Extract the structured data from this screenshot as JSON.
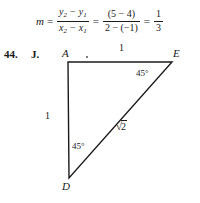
{
  "formula": {
    "variable": "m",
    "equals": "=",
    "slope_general": {
      "numerator_y2": "y",
      "numerator_sub2": "2",
      "minus": "−",
      "numerator_y1": "y",
      "numerator_sub1": "1",
      "denominator_x2": "x",
      "denominator_x1": "x"
    },
    "slope_substituted": {
      "numerator": "(5 − 4)",
      "denominator": "2 − (−1)"
    },
    "result": {
      "numerator": "1",
      "denominator": "3"
    }
  },
  "problem": {
    "number": "44.",
    "letter": "J."
  },
  "figure": {
    "type": "right-triangle",
    "vertices": [
      {
        "label": "A",
        "x": 68,
        "y": 62,
        "role": "right-angle-corner"
      },
      {
        "label": "E",
        "x": 172,
        "y": 62,
        "role": "upper-right"
      },
      {
        "label": "D",
        "x": 69,
        "y": 178,
        "role": "lower-left"
      }
    ],
    "side_labels": [
      {
        "text": "1",
        "side": "AE-top",
        "x": 120,
        "y": 44
      },
      {
        "text": "1",
        "side": "AD-left",
        "x": 45,
        "y": 112
      }
    ],
    "hypotenuse_label": {
      "radical_sign": "√",
      "radicand": "2",
      "x": 116,
      "y": 120
    },
    "angle_labels": [
      {
        "text": "45°",
        "at_vertex": "E",
        "x": 136,
        "y": 68
      },
      {
        "text": "45°",
        "at_vertex": "D",
        "x": 72,
        "y": 140
      }
    ],
    "stroke_color": "#1a1a1a"
  }
}
